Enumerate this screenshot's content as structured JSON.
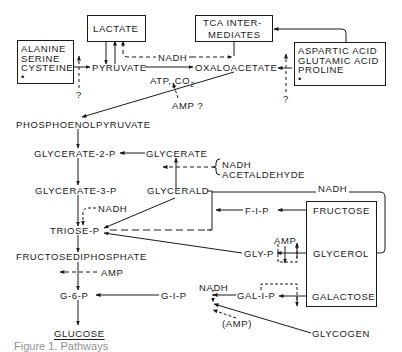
{
  "diagram": {
    "boxes": {
      "lactate": "LACTATE",
      "tca": [
        "TCA INTER-",
        "MEDIATES"
      ],
      "alanine": [
        "ALANINE",
        "SERINE",
        "CYSTEINE",
        "•"
      ],
      "aspartic": [
        "ASPARTIC ACID",
        "GLUTAMIC ACID",
        "PROLINE",
        "•"
      ],
      "sugars": [
        "FRUCTOSE",
        "GLYCEROL",
        "GALACTOSE"
      ]
    },
    "nodes": {
      "pyruvate": "PYRUVATE",
      "oxaloacetate": "OXALOACETATE",
      "pep": "PHOSPHOENOLPYRUVATE",
      "g2p": "GLYCERATE-2-P",
      "glycerate": "GLYCERATE",
      "g3p": "GLYCERATE-3-P",
      "glyceraldehyde": "GLYCERALD",
      "triose": "TRIOSE-P",
      "fdp": "FRUCTOSEDIPHOSPHATE",
      "g6p": "G-6-P",
      "glucose": "GLUCOSE",
      "f1p": "F-I-P",
      "glyp": "GLY-P",
      "g1p": "G-I-P",
      "gal1p": "GAL-I-P",
      "glycogen": "GLYCOGEN"
    },
    "labels": {
      "nadh_top": "NADH",
      "atp_co2": "ATP, CO",
      "co2_sub": "2",
      "amp_q": "AMP ?",
      "q_left": "?",
      "q_right": "?",
      "nadh_acet_1": "NADH",
      "nadh_acet_2": "ACETALDEHYDE",
      "nadh_right": "NADH",
      "nadh_triose": "NADH",
      "amp_fdp": "AMP",
      "amp_gly": "AMP",
      "nadh_g1p": "NADH",
      "amp_paren": "(AMP)"
    },
    "caption": "Figure 1. Pathways"
  }
}
